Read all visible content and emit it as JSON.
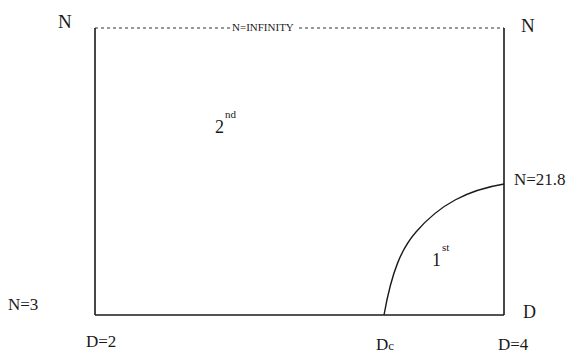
{
  "diagram": {
    "axis_labels": {
      "top_left": "N",
      "top_right": "N",
      "right_bottom": "D"
    },
    "boundary_labels": {
      "top": "N=INFINITY",
      "n_min": "N=3",
      "n_critical": "N=21.8",
      "d_min": "D=2",
      "d_critical": "Dc",
      "d_max": "D=4"
    },
    "regions": [
      {
        "name": "second-order",
        "number": "2",
        "suffix": "nd"
      },
      {
        "name": "first-order",
        "number": "1",
        "suffix": "st"
      }
    ],
    "colors": {
      "line": "#1a1a1a",
      "background": "#ffffff"
    }
  }
}
